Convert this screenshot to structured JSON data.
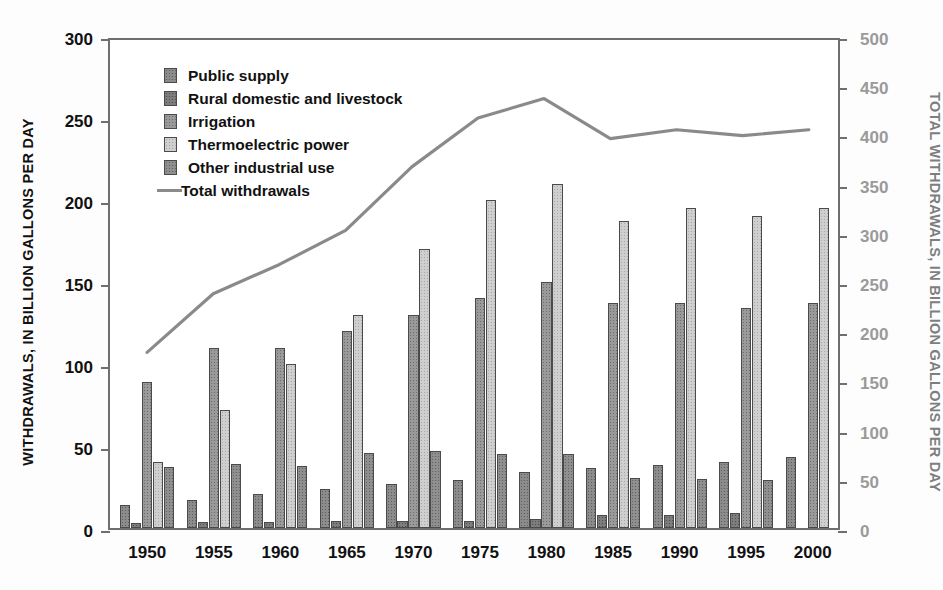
{
  "chart_data": {
    "type": "bar",
    "title": "",
    "xlabel": "",
    "ylabel": "WITHDRAWALS, IN BILLION GALLONS PER DAY",
    "ylabel_right": "TOTAL WITHDRAWALS, IN BILLION GALLONS PER DAY",
    "categories": [
      "1950",
      "1955",
      "1960",
      "1965",
      "1970",
      "1975",
      "1980",
      "1985",
      "1990",
      "1995",
      "2000"
    ],
    "ylim": [
      0,
      300
    ],
    "yticks": [
      0,
      50,
      100,
      150,
      200,
      250,
      300
    ],
    "ylim_right": [
      0,
      500
    ],
    "yticks_right": [
      0,
      50,
      100,
      150,
      200,
      250,
      300,
      350,
      400,
      450,
      500
    ],
    "grid": false,
    "legend_position": "upper-left",
    "series": [
      {
        "name": "Public supply",
        "axis": "left",
        "kind": "bar",
        "color": "#8c8c8c",
        "values": [
          14,
          17,
          21,
          24,
          27,
          29,
          34,
          36.5,
          38.5,
          40,
          43
        ]
      },
      {
        "name": "Rural domestic and livestock",
        "axis": "left",
        "kind": "bar",
        "color": "#7d7d7d",
        "values": [
          3,
          3.5,
          3.6,
          4,
          4.5,
          4.5,
          5.6,
          7.8,
          7.9,
          9,
          0
        ]
      },
      {
        "name": "Irrigation",
        "axis": "left",
        "kind": "bar",
        "color": "#9a9a9a",
        "values": [
          89,
          110,
          110,
          120,
          130,
          140,
          150,
          137,
          137,
          134,
          137
        ]
      },
      {
        "name": "Thermoelectric power",
        "axis": "left",
        "kind": "bar",
        "color": "#cfcfcf",
        "values": [
          40,
          72,
          100,
          130,
          170,
          200,
          210,
          187,
          195,
          190,
          195
        ]
      },
      {
        "name": "Other industrial use",
        "axis": "left",
        "kind": "bar",
        "color": "#8f8f8f",
        "values": [
          37,
          39,
          38,
          46,
          47,
          45,
          45,
          30.5,
          30,
          29,
          0
        ]
      },
      {
        "name": "Total withdrawals",
        "axis": "right",
        "kind": "line",
        "color": "#8a8a8a",
        "values": [
          180,
          240,
          270,
          305,
          370,
          420,
          440,
          399,
          408,
          402,
          408
        ]
      }
    ]
  },
  "legend": {
    "items": [
      {
        "label": "Public supply"
      },
      {
        "label": "Rural domestic and livestock"
      },
      {
        "label": "Irrigation"
      },
      {
        "label": "Thermoelectric power"
      },
      {
        "label": "Other industrial use"
      }
    ],
    "line_item": {
      "label": "Total withdrawals"
    }
  },
  "colors": {
    "frame": "#6f6f6f",
    "left_axis_text": "#111111",
    "right_axis_text": "#9a9a9a",
    "line": "#8a8a8a",
    "background": "#ffffff"
  }
}
